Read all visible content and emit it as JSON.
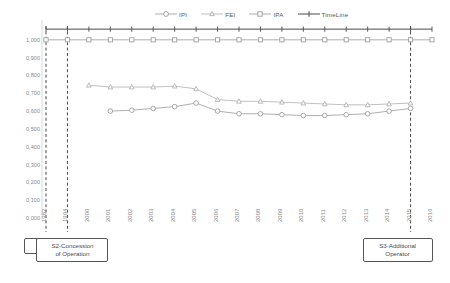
{
  "legend": {
    "position": "top-center",
    "entries": [
      {
        "name": "IPI",
        "marker": "circle",
        "color": "#9a9a9a"
      },
      {
        "name": "FEI",
        "marker": "triangle",
        "color": "#9a9a9a"
      },
      {
        "name": "IPA",
        "marker": "square",
        "color": "#9a9a9a"
      },
      {
        "name": "TimeLine",
        "marker": "cross",
        "color": "#4a4a4a"
      }
    ]
  },
  "annotations": [
    {
      "id": "s1",
      "label": "S1-Award",
      "year": "1982"
    },
    {
      "id": "s2",
      "label": "S2-Concession\nof Operation",
      "line1": "S2-Concession",
      "line2": "of Operation",
      "year": "1994"
    },
    {
      "id": "s3",
      "label": "S3-Additional\nOperator",
      "line1": "S3-Additional",
      "line2": "Operator",
      "year": "2015"
    }
  ],
  "chart_data": {
    "type": "line",
    "title": "",
    "xlabel": "",
    "ylabel": "",
    "grid": false,
    "ylim": [
      0.0,
      1.1
    ],
    "yticks": [
      "1,000",
      "0,900",
      "0,800",
      "0,700",
      "0,600",
      "0,500",
      "0,400",
      "0,300",
      "0,200",
      "0,100",
      "0,000"
    ],
    "ytick_values": [
      1.0,
      0.9,
      0.8,
      0.7,
      0.6,
      0.5,
      0.4,
      0.3,
      0.2,
      0.1,
      0.0
    ],
    "categories": [
      "1982",
      "1994",
      "2000",
      "2001",
      "2002",
      "2003",
      "2004",
      "2005",
      "2006",
      "2007",
      "2008",
      "2009",
      "2010",
      "2011",
      "2012",
      "2013",
      "2014",
      "2015",
      "2016"
    ],
    "series": [
      {
        "name": "TimeLine",
        "marker": "cross",
        "color": "#4a4a4a",
        "x": [
          "1982",
          "1994",
          "2000",
          "2001",
          "2002",
          "2003",
          "2004",
          "2005",
          "2006",
          "2007",
          "2008",
          "2009",
          "2010",
          "2011",
          "2012",
          "2013",
          "2014",
          "2015",
          "2016"
        ],
        "values": [
          1.06,
          1.06,
          1.06,
          1.06,
          1.06,
          1.06,
          1.06,
          1.06,
          1.06,
          1.06,
          1.06,
          1.06,
          1.06,
          1.06,
          1.06,
          1.06,
          1.06,
          1.06,
          1.06
        ]
      },
      {
        "name": "IPA",
        "marker": "square",
        "color": "#9a9a9a",
        "x": [
          "1982",
          "1994",
          "2000",
          "2001",
          "2002",
          "2003",
          "2004",
          "2005",
          "2006",
          "2007",
          "2008",
          "2009",
          "2010",
          "2011",
          "2012",
          "2013",
          "2014",
          "2015",
          "2016"
        ],
        "values": [
          1.0,
          1.0,
          1.0,
          1.0,
          1.0,
          1.0,
          1.0,
          1.0,
          1.0,
          1.0,
          1.0,
          1.0,
          1.0,
          1.0,
          1.0,
          1.0,
          1.0,
          1.0,
          1.0
        ]
      },
      {
        "name": "FEI",
        "marker": "triangle",
        "color": "#b0b0b0",
        "x": [
          "2000",
          "2001",
          "2002",
          "2003",
          "2004",
          "2005",
          "2006",
          "2007",
          "2008",
          "2009",
          "2010",
          "2011",
          "2012",
          "2013",
          "2014",
          "2015"
        ],
        "values": [
          0.745,
          0.735,
          0.735,
          0.735,
          0.74,
          0.725,
          0.665,
          0.655,
          0.655,
          0.65,
          0.645,
          0.64,
          0.635,
          0.635,
          0.64,
          0.645
        ]
      },
      {
        "name": "IPI",
        "marker": "circle",
        "color": "#9a9a9a",
        "x": [
          "2001",
          "2002",
          "2003",
          "2004",
          "2005",
          "2006",
          "2007",
          "2008",
          "2009",
          "2010",
          "2011",
          "2012",
          "2013",
          "2014",
          "2015"
        ],
        "values": [
          0.6,
          0.605,
          0.615,
          0.625,
          0.645,
          0.6,
          0.585,
          0.585,
          0.58,
          0.575,
          0.575,
          0.58,
          0.585,
          0.6,
          0.615
        ]
      }
    ]
  }
}
